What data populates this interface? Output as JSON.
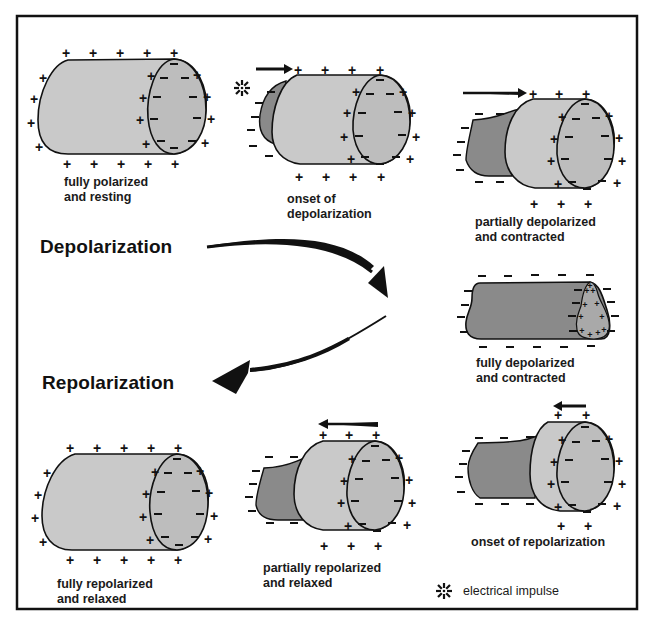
{
  "figure": {
    "frame_color": "#111111",
    "colors": {
      "polarized_fill": "#c9c9c9",
      "end_oval_fill": "#bdbdbd",
      "depolarized_fill": "#8a8a8a",
      "outline": "#111111"
    },
    "headings": {
      "depolarization": "Depolarization",
      "repolarization": "Repolarization"
    },
    "cells": [
      {
        "id": "fully-polarized",
        "caption": "fully polarized\nand resting",
        "outside_charge": "+",
        "inside_charge": "-",
        "impulse_direction": "none"
      },
      {
        "id": "onset-depolarization",
        "caption": "onset of\ndepolarization",
        "outside_charge": "+",
        "inside_charge": "-",
        "impulse_direction": "right"
      },
      {
        "id": "partially-depolarized",
        "caption": "partially depolarized\nand contracted",
        "outside_charge": "+",
        "inside_charge": "-",
        "impulse_direction": "right"
      },
      {
        "id": "fully-depolarized",
        "caption": "fully depolarized\nand contracted",
        "outside_charge": "-",
        "inside_charge": "+",
        "impulse_direction": "none"
      },
      {
        "id": "onset-repolarization",
        "caption": "onset of repolarization",
        "outside_charge": "+",
        "inside_charge": "-",
        "impulse_direction": "left"
      },
      {
        "id": "partially-repolarized",
        "caption": "partially repolarized\nand relaxed",
        "outside_charge": "+",
        "inside_charge": "-",
        "impulse_direction": "left"
      },
      {
        "id": "fully-repolarized",
        "caption": "fully repolarized\nand relaxed",
        "outside_charge": "+",
        "inside_charge": "-",
        "impulse_direction": "none"
      }
    ],
    "legend": {
      "icon": "electrical-impulse-icon",
      "label": "electrical impulse"
    },
    "signs": {
      "plus": "+",
      "minus": "–"
    }
  }
}
